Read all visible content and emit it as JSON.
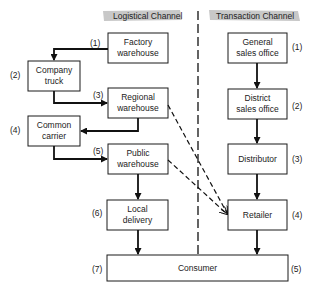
{
  "headers": {
    "logistical": "Logistical Channel",
    "transaction": "Transaction Channel"
  },
  "logistical_channel": [
    {
      "num": "(1)",
      "line1": "Factory",
      "line2": "warehouse"
    },
    {
      "num": "(2)",
      "line1": "Company",
      "line2": "truck"
    },
    {
      "num": "(3)",
      "line1": "Regional",
      "line2": "warehouse"
    },
    {
      "num": "(4)",
      "line1": "Common",
      "line2": "carrier"
    },
    {
      "num": "(5)",
      "line1": "Public",
      "line2": "warehouse"
    },
    {
      "num": "(6)",
      "line1": "Local",
      "line2": "delivery"
    },
    {
      "num": "(7)"
    }
  ],
  "transaction_channel": [
    {
      "num": "(1)",
      "line1": "General",
      "line2": "sales office"
    },
    {
      "num": "(2)",
      "line1": "District",
      "line2": "sales office"
    },
    {
      "num": "(3)",
      "line1": "Distributor"
    },
    {
      "num": "(4)",
      "line1": "Retailer"
    },
    {
      "num": "(5)"
    }
  ],
  "consumer": {
    "label": "Consumer"
  },
  "colors": {
    "line": "#111111",
    "header_bg": "#c8c8c8",
    "box_fill": "#ffffff"
  }
}
